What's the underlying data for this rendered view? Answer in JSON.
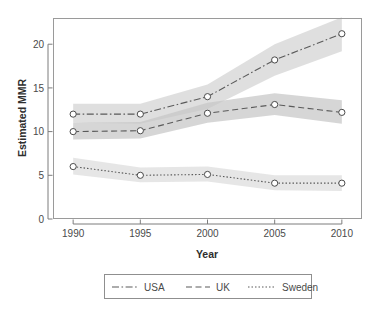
{
  "chart_data": {
    "type": "line",
    "title": "",
    "xlabel": "Year",
    "ylabel": "Estimated MMR",
    "x": [
      1990,
      1995,
      2000,
      2005,
      2010
    ],
    "xtick_labels": [
      "1990",
      "1995",
      "2000",
      "2005",
      "2010"
    ],
    "ytick_labels": [
      "0",
      "5",
      "10",
      "15",
      "20"
    ],
    "ytick_values": [
      0,
      5,
      10,
      15,
      20
    ],
    "xlim": [
      1988.5,
      2011.5
    ],
    "ylim": [
      0,
      23
    ],
    "grid": false,
    "legend_position": "bottom",
    "marker": "open-circle",
    "series": [
      {
        "name": "USA",
        "linestyle": "dash-dot",
        "color": "#5a5a5a",
        "values": [
          12.0,
          12.0,
          14.0,
          18.2,
          21.2
        ],
        "ci_lower": [
          11.0,
          10.9,
          12.6,
          16.4,
          19.2
        ],
        "ci_upper": [
          13.2,
          13.2,
          15.4,
          20.0,
          23.1
        ]
      },
      {
        "name": "UK",
        "linestyle": "dashed",
        "color": "#5a5a5a",
        "values": [
          10.0,
          10.1,
          12.1,
          13.1,
          12.2
        ],
        "ci_lower": [
          9.1,
          9.2,
          11.0,
          11.9,
          10.9
        ],
        "ci_upper": [
          11.0,
          11.1,
          13.3,
          14.4,
          13.6
        ]
      },
      {
        "name": "Sweden",
        "linestyle": "dotted",
        "color": "#5a5a5a",
        "values": [
          6.0,
          5.0,
          5.1,
          4.1,
          4.1
        ],
        "ci_lower": [
          5.1,
          4.2,
          4.3,
          3.3,
          3.2
        ],
        "ci_upper": [
          7.0,
          5.9,
          6.0,
          5.0,
          5.0
        ]
      }
    ]
  },
  "axes": {
    "y_title": "Estimated MMR",
    "x_title": "Year",
    "y_ticks": [
      "0",
      "5",
      "10",
      "15",
      "20"
    ],
    "x_ticks": [
      "1990",
      "1995",
      "2000",
      "2005",
      "2010"
    ]
  },
  "legend": {
    "entries": [
      {
        "label": "USA",
        "style": "dash-dot"
      },
      {
        "label": "UK",
        "style": "dashed"
      },
      {
        "label": "Sweden",
        "style": "dotted"
      }
    ]
  },
  "colors": {
    "line": "#5a5a5a",
    "band": "#c9c9c9",
    "band_dark": "#a8a8a8",
    "panel_border": "#9a9a9a",
    "text": "#4a4a4a",
    "background": "#ffffff"
  }
}
